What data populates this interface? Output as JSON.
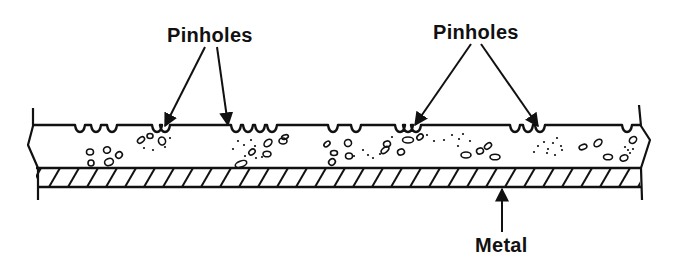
{
  "diagram": {
    "colors": {
      "ink": "#111111",
      "background": "#ffffff"
    },
    "labels": [
      {
        "id": "pinholes-left",
        "text": "Pinholes",
        "x": 167,
        "y": 25
      },
      {
        "id": "pinholes-right",
        "text": "Pinholes",
        "x": 433,
        "y": 22
      },
      {
        "id": "metal",
        "text": "Metal",
        "x": 475,
        "y": 235
      }
    ],
    "layers": {
      "coating": {
        "name": "Coating (with voids and inclusions)",
        "top_y": 125,
        "bottom_y": 168
      },
      "metal": {
        "name": "Metal",
        "top_y": 168,
        "bottom_y": 187,
        "hatch_spacing": 19
      }
    },
    "arrows": [
      {
        "from": [
          205,
          47
        ],
        "to": [
          165,
          126
        ],
        "target": "pinhole"
      },
      {
        "from": [
          217,
          47
        ],
        "to": [
          228,
          125
        ],
        "target": "pinhole"
      },
      {
        "from": [
          471,
          44
        ],
        "to": [
          415,
          125
        ],
        "target": "pinhole"
      },
      {
        "from": [
          481,
          44
        ],
        "to": [
          538,
          126
        ],
        "target": "pinhole"
      },
      {
        "from": [
          502,
          232
        ],
        "to": [
          502,
          189
        ],
        "target": "metal"
      }
    ],
    "pinhole_dips": [
      80,
      96,
      112,
      157,
      165,
      236,
      248,
      260,
      272,
      333,
      356,
      400,
      408,
      416,
      515,
      528,
      540,
      627
    ],
    "voids": [
      [
        90,
        152,
        3.5,
        3
      ],
      [
        107,
        150,
        3.5,
        3.2
      ],
      [
        119,
        155,
        3.5,
        3
      ],
      [
        91,
        163,
        3,
        3
      ],
      [
        109,
        162,
        4.5,
        3.5
      ],
      [
        141,
        140,
        4,
        2.5
      ],
      [
        150,
        136,
        3,
        2.5
      ],
      [
        162,
        141,
        3.5,
        4
      ],
      [
        268,
        143,
        4.5,
        3
      ],
      [
        283,
        141,
        4,
        3
      ],
      [
        285,
        137,
        3.5,
        2
      ],
      [
        252,
        152,
        3.5,
        2.5
      ],
      [
        267,
        154,
        4,
        2.8
      ],
      [
        241,
        164,
        6,
        3
      ],
      [
        327,
        144,
        3.5,
        2.2
      ],
      [
        334,
        153,
        3.5,
        2.5
      ],
      [
        348,
        143,
        3.5,
        3.5
      ],
      [
        332,
        162,
        3.5,
        3
      ],
      [
        349,
        156,
        3.5,
        3
      ],
      [
        387,
        144,
        3.5,
        3
      ],
      [
        385,
        150,
        4.5,
        2.5
      ],
      [
        408,
        140,
        5.5,
        3
      ],
      [
        401,
        152,
        3.5,
        3
      ],
      [
        420,
        137,
        3.5,
        2.5
      ],
      [
        466,
        155,
        5,
        3
      ],
      [
        480,
        151,
        3.5,
        3
      ],
      [
        488,
        146,
        4,
        2.5
      ],
      [
        495,
        157,
        5,
        2.8
      ],
      [
        583,
        147,
        4,
        2.5
      ],
      [
        598,
        143,
        4.5,
        3
      ],
      [
        608,
        157,
        4.5,
        2.8
      ],
      [
        624,
        158,
        4,
        3
      ],
      [
        633,
        140,
        4,
        3
      ]
    ],
    "specks": [
      [
        144,
        148
      ],
      [
        153,
        150
      ],
      [
        165,
        147
      ],
      [
        170,
        138
      ],
      [
        238,
        141
      ],
      [
        244,
        145
      ],
      [
        251,
        140
      ],
      [
        255,
        146
      ],
      [
        245,
        156
      ],
      [
        256,
        158
      ],
      [
        262,
        157
      ],
      [
        233,
        149
      ],
      [
        363,
        150
      ],
      [
        368,
        155
      ],
      [
        373,
        158
      ],
      [
        380,
        154
      ],
      [
        354,
        156
      ],
      [
        427,
        135
      ],
      [
        434,
        141
      ],
      [
        392,
        137
      ],
      [
        452,
        135
      ],
      [
        459,
        139
      ],
      [
        463,
        134
      ],
      [
        458,
        146
      ],
      [
        470,
        141
      ],
      [
        444,
        140
      ],
      [
        538,
        146
      ],
      [
        544,
        142
      ],
      [
        548,
        149
      ],
      [
        553,
        143
      ],
      [
        557,
        138
      ],
      [
        547,
        153
      ],
      [
        555,
        155
      ],
      [
        562,
        150
      ],
      [
        534,
        152
      ],
      [
        561,
        146
      ],
      [
        625,
        147
      ],
      [
        628,
        150
      ],
      [
        633,
        149
      ],
      [
        630,
        153
      ]
    ]
  }
}
